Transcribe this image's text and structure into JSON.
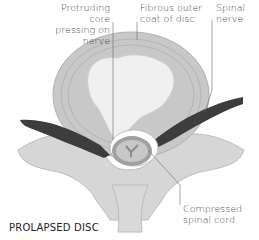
{
  "diagram": {
    "title": "PROLAPSED DISC",
    "labels": {
      "protruding_core": [
        "Protruding core",
        "pressing on nerve"
      ],
      "fibrous_coat": [
        "Fibrous outer",
        "coat of disc"
      ],
      "spinal_nerve": [
        "Spinal",
        "nerve"
      ],
      "compressed_cord": [
        "Compressed",
        "spinal cord"
      ]
    },
    "colors": {
      "bone": "#d6d6d6",
      "bone_shadow": "#bdbdbd",
      "disc_ring": "#c4c4c4",
      "disc_core": "#efefef",
      "nerve": "#3d3d3d",
      "cord": "#9a9a9a",
      "leader_line": "#6a6a6a"
    }
  }
}
